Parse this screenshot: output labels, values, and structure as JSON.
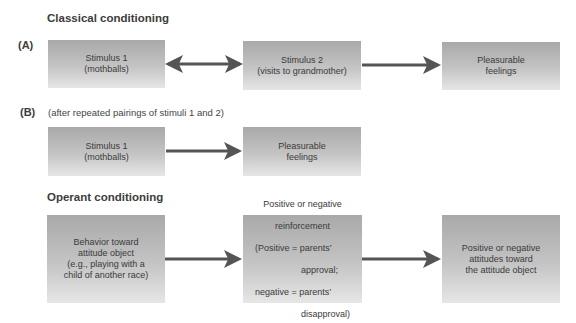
{
  "classical": {
    "heading": "Classical conditioning",
    "panel_a": {
      "label": "(A)",
      "boxes": [
        {
          "text": "Stimulus 1\n(mothballs)"
        },
        {
          "text": "Stimulus 2\n(visits to grandmother)"
        },
        {
          "text": "Pleasurable\nfeelings"
        }
      ],
      "arrows": [
        "double-arrow",
        "right-arrow"
      ]
    },
    "panel_b": {
      "label": "(B)",
      "note": "(after repeated pairings of stimuli 1 and 2)",
      "boxes": [
        {
          "text": "Stimulus 1\n(mothballs)"
        },
        {
          "text": "Pleasurable\nfeelings"
        }
      ],
      "arrows": [
        "right-arrow"
      ]
    }
  },
  "operant": {
    "heading": "Operant conditioning",
    "boxes": [
      {
        "text": "Behavior toward\nattitude object\n(e.g., playing with a\nchild of another race)"
      },
      {
        "line1": "Positive or negative",
        "line2": "reinforcement",
        "line3": "(Positive = parents’",
        "line4": "approval;",
        "line5": "negative = parents’",
        "line6": "disapproval)"
      },
      {
        "text": "Positive or negative\nattitudes toward\nthe attitude object"
      }
    ],
    "arrows": [
      "right-arrow",
      "right-arrow"
    ]
  },
  "colors": {
    "arrow": "#555555",
    "box_top": "#a9a9a9",
    "box_bottom": "#e6e6e6"
  }
}
